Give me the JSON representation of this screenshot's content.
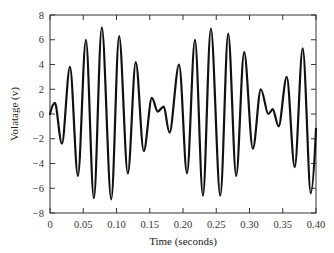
{
  "chart_data": {
    "type": "line",
    "title": "",
    "xlabel": "Time (seconds)",
    "ylabel": "Volatage (v)",
    "xlim": [
      0,
      0.4
    ],
    "ylim": [
      -8,
      8
    ],
    "xticks": [
      0,
      0.05,
      0.1,
      0.15,
      0.2,
      0.25,
      0.3,
      0.35,
      0.4
    ],
    "xtick_labels": [
      "0",
      "0.05",
      "0.10",
      "0.15",
      "0.20",
      "0.25",
      "0.30",
      "0.35",
      "0.40"
    ],
    "yticks": [
      8,
      6,
      4,
      2,
      0,
      -2,
      -4,
      -6,
      -8
    ],
    "ytick_labels": [
      "8",
      "6",
      "4",
      "2",
      "0",
      "−2",
      "−4",
      "−6",
      "−8"
    ],
    "grid": false,
    "legend": null,
    "series": [
      {
        "name": "voltage",
        "color": "#111111",
        "x": [
          0,
          0.0075,
          0.018,
          0.03,
          0.042,
          0.054,
          0.066,
          0.078,
          0.092,
          0.104,
          0.117,
          0.129,
          0.141,
          0.153,
          0.162,
          0.171,
          0.18,
          0.194,
          0.206,
          0.218,
          0.23,
          0.242,
          0.256,
          0.268,
          0.28,
          0.292,
          0.305,
          0.317,
          0.328,
          0.335,
          0.344,
          0.356,
          0.368,
          0.38,
          0.392,
          0.4
        ],
        "y": [
          0,
          0.9,
          -2.4,
          3.8,
          -5.0,
          6.0,
          -6.8,
          7.0,
          -6.9,
          6.3,
          -4.8,
          4.2,
          -3.0,
          1.3,
          0.2,
          0.6,
          -1.5,
          4.0,
          -4.8,
          6.0,
          -6.6,
          6.9,
          -6.6,
          6.5,
          -5.0,
          5.0,
          -2.8,
          2.0,
          0.0,
          0.4,
          -1.0,
          3.0,
          -4.3,
          5.3,
          -6.4,
          -1.2
        ]
      }
    ]
  }
}
